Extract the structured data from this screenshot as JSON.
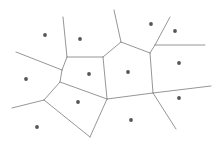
{
  "diagram": {
    "type": "voronoi",
    "width": 223,
    "height": 143,
    "background": "#ffffff",
    "edge_color": "#8a8a8a",
    "site_color": "#555555",
    "sites": [
      {
        "x": 45,
        "y": 35
      },
      {
        "x": 80,
        "y": 39
      },
      {
        "x": 151,
        "y": 24
      },
      {
        "x": 175,
        "y": 31
      },
      {
        "x": 89,
        "y": 74
      },
      {
        "x": 128,
        "y": 72
      },
      {
        "x": 179,
        "y": 63
      },
      {
        "x": 26,
        "y": 79
      },
      {
        "x": 78,
        "y": 102
      },
      {
        "x": 179,
        "y": 98
      },
      {
        "x": 37,
        "y": 127
      },
      {
        "x": 131,
        "y": 120
      }
    ],
    "edges": [
      {
        "x1": 63,
        "y1": 17,
        "x2": 67,
        "y2": 57
      },
      {
        "x1": 16,
        "y1": 52,
        "x2": 62,
        "y2": 70
      },
      {
        "x1": 67,
        "y1": 57,
        "x2": 62,
        "y2": 70
      },
      {
        "x1": 67,
        "y1": 57,
        "x2": 103,
        "y2": 57
      },
      {
        "x1": 62,
        "y1": 70,
        "x2": 60,
        "y2": 82
      },
      {
        "x1": 60,
        "y1": 82,
        "x2": 107,
        "y2": 99
      },
      {
        "x1": 60,
        "y1": 82,
        "x2": 44,
        "y2": 100
      },
      {
        "x1": 44,
        "y1": 100,
        "x2": 12,
        "y2": 108
      },
      {
        "x1": 44,
        "y1": 100,
        "x2": 90,
        "y2": 137
      },
      {
        "x1": 90,
        "y1": 137,
        "x2": 107,
        "y2": 99
      },
      {
        "x1": 103,
        "y1": 57,
        "x2": 107,
        "y2": 99
      },
      {
        "x1": 103,
        "y1": 57,
        "x2": 121,
        "y2": 42
      },
      {
        "x1": 114,
        "y1": 10,
        "x2": 121,
        "y2": 42
      },
      {
        "x1": 121,
        "y1": 42,
        "x2": 150,
        "y2": 53
      },
      {
        "x1": 150,
        "y1": 53,
        "x2": 155,
        "y2": 45
      },
      {
        "x1": 155,
        "y1": 45,
        "x2": 170,
        "y2": 17
      },
      {
        "x1": 155,
        "y1": 45,
        "x2": 205,
        "y2": 45
      },
      {
        "x1": 150,
        "y1": 53,
        "x2": 153,
        "y2": 93
      },
      {
        "x1": 153,
        "y1": 93,
        "x2": 211,
        "y2": 86
      },
      {
        "x1": 153,
        "y1": 93,
        "x2": 107,
        "y2": 99
      },
      {
        "x1": 153,
        "y1": 93,
        "x2": 176,
        "y2": 129
      }
    ]
  }
}
